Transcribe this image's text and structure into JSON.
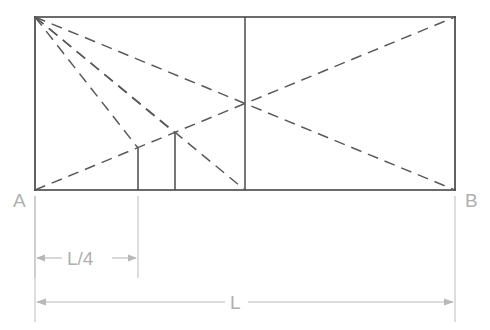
{
  "figure": {
    "colors": {
      "outline": "#3a3a3a",
      "inner_solid": "#4a4a4a",
      "dashed": "#5a5a5a",
      "dimension": "#b8b8b8",
      "label_text": "#b0b0b0",
      "background": "#ffffff"
    },
    "labels": {
      "left_support": "A",
      "right_support": "B",
      "quarter_span": "L/4",
      "full_span": "L"
    },
    "geometry": {
      "rect": {
        "left": 35,
        "top": 17,
        "right": 455,
        "bottom": 190
      },
      "mid_vertical_x": 245,
      "short_vertical_1": {
        "x": 138,
        "top": 148,
        "bottom": 190
      },
      "short_vertical_2": {
        "x": 175,
        "top": 133,
        "bottom": 190
      },
      "crossing_point": {
        "x": 245,
        "y": 103
      },
      "fan_origin": {
        "x": 35,
        "y": 17
      },
      "fan_targets": [
        {
          "x": 138,
          "y": 148
        },
        {
          "x": 175,
          "y": 133
        },
        {
          "x": 245,
          "y": 190
        },
        {
          "x": 455,
          "y": 190
        }
      ],
      "rising_diagonal": {
        "x1": 35,
        "y1": 190,
        "x2": 455,
        "y2": 17
      }
    },
    "dimensions": [
      {
        "name": "quarter-span",
        "label": "L/4",
        "from_x": 35,
        "to_x": 138,
        "y": 258
      },
      {
        "name": "full-span",
        "label": "L",
        "from_x": 35,
        "to_x": 455,
        "y": 302
      }
    ]
  }
}
